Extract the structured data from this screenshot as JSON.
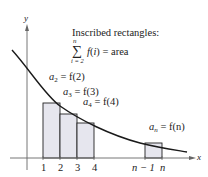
{
  "axes": {
    "x_label": "x",
    "y_label": "y"
  },
  "caption": {
    "title": "Inscribed rectangles:",
    "sum_upper": "n",
    "sum_lower": "i = 2",
    "sum_symbol": "∑",
    "sum_expr": "f(i) = area"
  },
  "labels": [
    {
      "var": "a",
      "sub": "2",
      "expr": "= f(2)"
    },
    {
      "var": "a",
      "sub": "3",
      "expr": "= f(3)"
    },
    {
      "var": "a",
      "sub": "4",
      "expr": "= f(4)"
    },
    {
      "var": "a",
      "sub": "n",
      "expr": "= f(n)"
    }
  ],
  "ticks": [
    "1",
    "2",
    "3",
    "4",
    "n − 1",
    "n"
  ],
  "colors": {
    "rect_fill": "#e4e4ec",
    "curve": "#1a1a1a"
  }
}
